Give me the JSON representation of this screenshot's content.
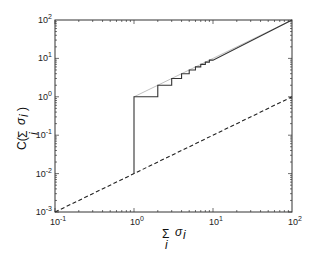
{
  "chart_data": {
    "type": "line",
    "title": "",
    "xlabel": "Σ_i σ_i",
    "ylabel": "C(Σ_i σ_i)",
    "xscale": "log",
    "yscale": "log",
    "xlim": [
      0.1,
      100
    ],
    "ylim": [
      0.001,
      100
    ],
    "grid": false,
    "legend": null,
    "x_ticks": [
      "10^-1",
      "10^0",
      "10^1",
      "10^2"
    ],
    "y_ticks": [
      "10^-3",
      "10^-2",
      "10^-1",
      "10^0",
      "10^1",
      "10^2"
    ],
    "series": [
      {
        "name": "reference y = x",
        "style": "thin gray solid",
        "color": "#b0b0b0",
        "x": [
          1,
          100
        ],
        "y": [
          1,
          100
        ]
      },
      {
        "name": "staircase C = floor(x)",
        "style": "solid dark",
        "color": "#333333",
        "x": [
          1,
          1,
          2,
          2,
          3,
          3,
          4,
          4,
          5,
          5,
          6,
          6,
          7,
          7,
          8,
          8,
          9,
          9,
          10,
          100
        ],
        "y": [
          0.01,
          1,
          1,
          2,
          2,
          3,
          3,
          4,
          4,
          5,
          5,
          6,
          6,
          7,
          7,
          8,
          8,
          9,
          9,
          100
        ]
      },
      {
        "name": "dashed y = 0.01 x",
        "style": "dashed",
        "color": "#222222",
        "x": [
          0.1,
          100
        ],
        "y": [
          0.001,
          1
        ]
      }
    ]
  },
  "axes": {
    "x_tick_labels": [
      {
        "base": "10",
        "exp": "-1"
      },
      {
        "base": "10",
        "exp": "0"
      },
      {
        "base": "10",
        "exp": "1"
      },
      {
        "base": "10",
        "exp": "2"
      }
    ],
    "y_tick_labels": [
      {
        "base": "10",
        "exp": "-3"
      },
      {
        "base": "10",
        "exp": "-2"
      },
      {
        "base": "10",
        "exp": "-1"
      },
      {
        "base": "10",
        "exp": "0"
      },
      {
        "base": "10",
        "exp": "1"
      },
      {
        "base": "10",
        "exp": "2"
      }
    ],
    "xlabel": {
      "sum": "Σ",
      "sub": "i",
      "sym": "σ",
      "symsub": "i"
    },
    "ylabel": {
      "prefix": "C(",
      "sum": "Σ",
      "sub": "i",
      "sym": "σ",
      "symsub": "i",
      "suffix": ")"
    }
  }
}
